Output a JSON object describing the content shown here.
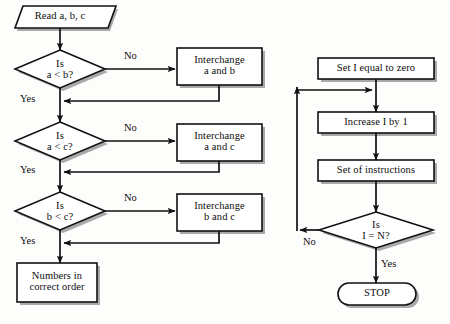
{
  "diagram": {
    "background_color": "#fdfdfc",
    "stroke_color": "#111111",
    "shape_fill_color": "#ffffff",
    "shadow_color": "#9a9a9a"
  },
  "left_chart": {
    "name": "sort-three-numbers-flowchart",
    "nodes": {
      "start": {
        "shape": "parallelogram",
        "text": "Read a, b, c"
      },
      "decision1": {
        "shape": "diamond",
        "line1": "Is",
        "line2": "a < b?"
      },
      "process1": {
        "shape": "rectangle",
        "line1": "Interchange",
        "line2": "a and b"
      },
      "decision2": {
        "shape": "diamond",
        "line1": "Is",
        "line2": "a < c?"
      },
      "process2": {
        "shape": "rectangle",
        "line1": "Interchange",
        "line2": "a and c"
      },
      "decision3": {
        "shape": "diamond",
        "line1": "Is",
        "line2": "b < c?"
      },
      "process3": {
        "shape": "rectangle",
        "line1": "Interchange",
        "line2": "b and c"
      },
      "end": {
        "shape": "rectangle",
        "line1": "Numbers in",
        "line2": "correct order"
      }
    },
    "edge_labels": {
      "no1": "No",
      "yes1": "Yes",
      "no2": "No",
      "yes2": "Yes",
      "no3": "No",
      "yes3": "Yes"
    }
  },
  "right_chart": {
    "name": "counter-loop-flowchart",
    "nodes": {
      "init": {
        "shape": "rectangle",
        "text": "Set I equal to zero"
      },
      "increment": {
        "shape": "rectangle",
        "text": "Increase I by 1"
      },
      "instructions": {
        "shape": "rectangle",
        "text": "Set of instructions"
      },
      "decision": {
        "shape": "diamond",
        "line1": "Is",
        "line2": "I = N?"
      },
      "stop": {
        "shape": "terminator",
        "text": "STOP"
      }
    },
    "edge_labels": {
      "no": "No",
      "yes": "Yes"
    }
  }
}
